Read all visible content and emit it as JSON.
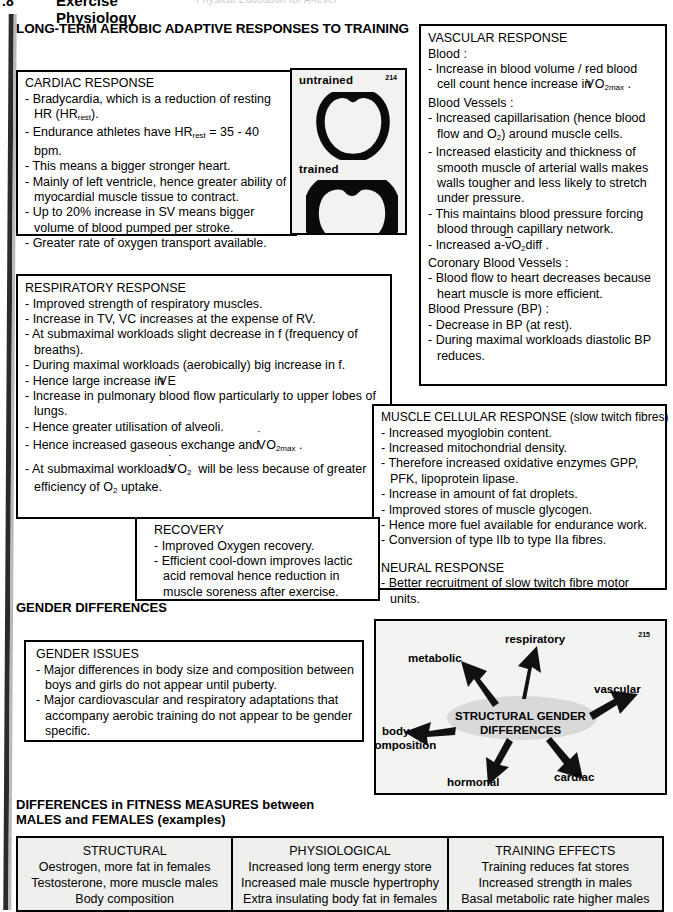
{
  "header": {
    "chapter_number": ".8",
    "title_line1": "Exercise",
    "title_line2": "Physiology",
    "running_head": "Physical Education for A-level"
  },
  "main_heading": "LONG-TERM AEROBIC ADAPTIVE RESPONSES TO TRAINING",
  "cardiac": {
    "title": "CARDIAC RESPONSE",
    "items": [
      "Bradycardia, which is a reduction of resting HR (HR_rest).",
      "Endurance athletes have HR_rest = 35 - 40 bpm.",
      "This means a bigger stronger heart.",
      "Mainly of left ventricle, hence greater ability of myocardial muscle tissue to contract.",
      "Up to 20% increase in SV means bigger volume of blood pumped per stroke.",
      "Greater rate of oxygen transport available."
    ]
  },
  "heart_figure": {
    "label_untrained": "untrained",
    "label_trained": "trained",
    "figure_number": "214"
  },
  "vascular": {
    "title": "VASCULAR RESPONSE",
    "groups": [
      {
        "heading": "Blood :",
        "items": [
          "Increase in blood volume / red blood cell count hence increase in VO2max ."
        ]
      },
      {
        "heading": "Blood Vessels :",
        "items": [
          "Increased capillarisation (hence blood flow and O2) around muscle cells.",
          "Increased elasticity and thickness of smooth muscle of arterial walls makes walls tougher and less likely to stretch under pressure.",
          "This maintains blood pressure forcing blood through capillary network.",
          "Increased a-vO2diff ."
        ]
      },
      {
        "heading": "Coronary Blood Vessels :",
        "items": [
          "Blood flow to heart decreases because heart muscle is more efficient."
        ]
      },
      {
        "heading": "Blood Pressure (BP) :",
        "items": [
          "Decrease in BP (at rest).",
          "During maximal workloads diastolic BP reduces."
        ]
      }
    ]
  },
  "respiratory": {
    "title": "RESPIRATORY RESPONSE",
    "items": [
      "Improved strength of respiratory muscles.",
      "Increase in TV, VC increases at the expense of RV.",
      "At submaximal workloads slight decrease in f (frequency of breaths).",
      "During maximal workloads (aerobically) big increase in f.",
      "Hence large increase in VE",
      "Increase in pulmonary blood flow particularly to upper lobes of lungs.",
      "Hence greater utilisation of alveoli.",
      "Hence increased gaseous exchange and VO2max .",
      "At submaximal workloads VO2 will be less because of greater efficiency of O2 uptake."
    ]
  },
  "muscle": {
    "title": "MUSCLE CELLULAR RESPONSE (slow twitch fibres)",
    "items": [
      "Increased myoglobin content.",
      "Increased mitochondrial density.",
      "Therefore increased oxidative enzymes GPP, PFK, lipoprotein lipase.",
      "Increase in amount of fat droplets.",
      "Improved stores of muscle glycogen.",
      "Hence more fuel available for endurance work.",
      "Conversion of type IIb to type IIa fibres."
    ]
  },
  "neural": {
    "title": "NEURAL RESPONSE",
    "items": [
      "Better recruitment of slow twitch fibre motor units."
    ]
  },
  "recovery": {
    "title": "RECOVERY",
    "items": [
      "Improved Oxygen recovery.",
      "Efficient cool-down improves lactic acid removal hence reduction in muscle soreness after exercise."
    ]
  },
  "gender_differences_label": "GENDER DIFFERENCES",
  "gender_issues": {
    "title": "GENDER ISSUES",
    "items": [
      "Major differences in body size and composition between boys and girls do not appear until puberty.",
      "Major cardiovascular and respiratory adaptations that accompany aerobic training do not appear to be gender specific."
    ]
  },
  "gender_diagram": {
    "center_line1": "STRUCTURAL GENDER",
    "center_line2": "DIFFERENCES",
    "figure_number": "215",
    "nodes": [
      "respiratory",
      "metabolic",
      "vascular",
      "body",
      "composition",
      "hormonal",
      "cardiac"
    ]
  },
  "fitness_heading_line1": "DIFFERENCES in FITNESS MEASURES between",
  "fitness_heading_line2": "MALES and FEMALES (examples)",
  "fitness_table": {
    "columns": [
      {
        "header": "STRUCTURAL",
        "rows": [
          "Oestrogen, more fat in females",
          "Testosterone, more muscle males",
          "Body composition"
        ]
      },
      {
        "header": "PHYSIOLOGICAL",
        "rows": [
          "Increased long term energy store",
          "Increased male muscle hypertrophy",
          "Extra insulating body fat in females"
        ]
      },
      {
        "header": "TRAINING EFFECTS",
        "rows": [
          "Training reduces fat stores",
          "Increased strength in males",
          "Basal metabolic rate higher males"
        ]
      }
    ]
  }
}
